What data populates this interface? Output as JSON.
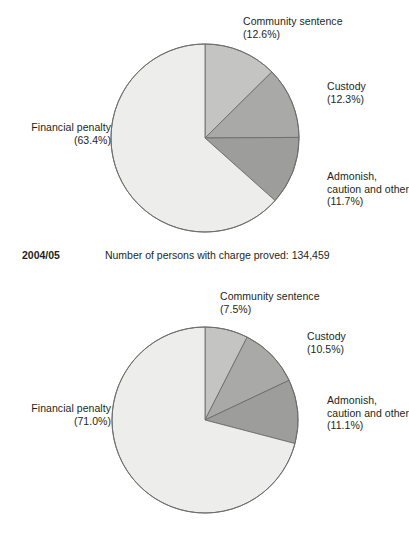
{
  "figure": {
    "background_color": "#ffffff",
    "text_color": "#231f20",
    "caption": {
      "year": "2004/05",
      "text": "Number of persons with charge proved: 134,459"
    }
  },
  "palette": {
    "financial_penalty": "#ededeb",
    "community_sentence": "#c4c4c2",
    "custody": "#a9a9a7",
    "admonish_caution_other": "#9d9d9b",
    "outline": "#6d6d6d"
  },
  "chart_data": [
    {
      "id": "chart-top",
      "type": "pie",
      "title": "",
      "start_angle_deg": 0,
      "direction": "clockwise",
      "legend_position": "callout-labels",
      "grid": false,
      "categories": [
        "Community sentence",
        "Custody",
        "Admonish, caution and other",
        "Financial penalty"
      ],
      "values": [
        12.6,
        12.3,
        11.7,
        63.4
      ],
      "slices": [
        {
          "label": "Community sentence",
          "label_lines": [
            "Community sentence"
          ],
          "value": 12.6,
          "value_text": "(12.6%)",
          "color": "#c4c4c2"
        },
        {
          "label": "Custody",
          "label_lines": [
            "Custody"
          ],
          "value": 12.3,
          "value_text": "(12.3%)",
          "color": "#a9a9a7"
        },
        {
          "label": "Admonish, caution and other",
          "label_lines": [
            "Admonish,",
            "caution and other"
          ],
          "value": 11.7,
          "value_text": "(11.7%)",
          "color": "#9d9d9b"
        },
        {
          "label": "Financial penalty",
          "label_lines": [
            "Financial penalty"
          ],
          "value": 63.4,
          "value_text": "(63.4%)",
          "color": "#ededeb"
        }
      ]
    },
    {
      "id": "chart-bottom",
      "type": "pie",
      "title": "",
      "start_angle_deg": 0,
      "direction": "clockwise",
      "legend_position": "callout-labels",
      "grid": false,
      "categories": [
        "Community sentence",
        "Custody",
        "Admonish, caution and other",
        "Financial penalty"
      ],
      "values": [
        7.5,
        10.5,
        11.1,
        71.0
      ],
      "slices": [
        {
          "label": "Community sentence",
          "label_lines": [
            "Community sentence"
          ],
          "value": 7.5,
          "value_text": "(7.5%)",
          "color": "#c4c4c2"
        },
        {
          "label": "Custody",
          "label_lines": [
            "Custody"
          ],
          "value": 10.5,
          "value_text": "(10.5%)",
          "color": "#a9a9a7"
        },
        {
          "label": "Admonish, caution and other",
          "label_lines": [
            "Admonish,",
            "caution and other"
          ],
          "value": 11.1,
          "value_text": "(11.1%)",
          "color": "#9d9d9b"
        },
        {
          "label": "Financial penalty",
          "label_lines": [
            "Financial penalty"
          ],
          "value": 71.0,
          "value_text": "(71.0%)",
          "color": "#ededeb"
        }
      ]
    }
  ]
}
